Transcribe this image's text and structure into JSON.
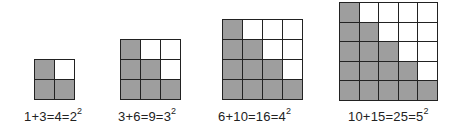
{
  "figures": [
    {
      "size": 2,
      "left": 34,
      "top": 59,
      "cell": 20,
      "rows": [
        [
          1,
          0
        ],
        [
          1,
          1
        ]
      ],
      "label": {
        "expr": "1+3=4=2",
        "exp": "2",
        "left": 24,
        "top": 108
      }
    },
    {
      "size": 3,
      "left": 120,
      "top": 39,
      "cell": 20,
      "rows": [
        [
          1,
          0,
          0
        ],
        [
          1,
          1,
          0
        ],
        [
          1,
          1,
          1
        ]
      ],
      "label": {
        "expr": "3+6=9=3",
        "exp": "2",
        "left": 118,
        "top": 108
      }
    },
    {
      "size": 4,
      "left": 222,
      "top": 19,
      "cell": 20,
      "rows": [
        [
          1,
          0,
          0,
          0
        ],
        [
          1,
          1,
          0,
          0
        ],
        [
          1,
          1,
          1,
          0
        ],
        [
          1,
          1,
          1,
          1
        ]
      ],
      "label": {
        "expr": "6+10=16=4",
        "exp": "2",
        "left": 218,
        "top": 108
      }
    },
    {
      "size": 5,
      "left": 339,
      "top": 0,
      "cell": 19.6,
      "rows": [
        [
          1,
          0,
          0,
          0,
          0
        ],
        [
          1,
          1,
          0,
          0,
          0
        ],
        [
          1,
          1,
          1,
          0,
          0
        ],
        [
          1,
          1,
          1,
          1,
          0
        ],
        [
          1,
          1,
          1,
          1,
          1
        ]
      ],
      "label": {
        "expr": "10+15=25=5",
        "exp": "2",
        "left": 348,
        "top": 108
      }
    }
  ],
  "colors": {
    "filled": "#9e9e9e",
    "empty": "#ffffff",
    "line": "#222222"
  }
}
